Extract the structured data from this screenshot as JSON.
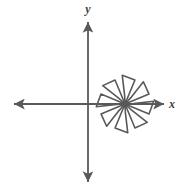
{
  "figure": {
    "kind": "coordinate-plane-with-rotational-figure",
    "background_color": "#ffffff",
    "stroke_color": "#595959",
    "label_color": "#3d3d3d",
    "width": 187,
    "height": 194
  },
  "axes": {
    "x_axis": {
      "label": "x",
      "label_x": 172,
      "label_y": 108,
      "y_position": 104,
      "x_start": 12,
      "x_end": 166,
      "arrow_both_ends": true
    },
    "y_axis": {
      "label": "y",
      "label_x": 88,
      "label_y": 13,
      "x_position": 88,
      "y_start": 20,
      "y_end": 184,
      "arrow_both_ends": true
    },
    "origin": {
      "x": 88,
      "y": 104
    }
  },
  "chart_data": {
    "type": "scatter",
    "title": "",
    "xlabel": "x",
    "ylabel": "y",
    "grid": false,
    "legend": false,
    "axis_arrows": "both",
    "shape": {
      "name": "eight-blade-pinwheel",
      "description": "Eight-fold rotationally symmetric pinwheel of triangular blades radiating from a common center point",
      "center": {
        "x": 125,
        "y": 104
      },
      "blade_count": 8,
      "rotational_symmetry_order": 8,
      "rotation_angle_degrees": 45,
      "spoke_length": 26,
      "has_reflection_symmetry": false,
      "fill": "none",
      "stroke_width": 1.6
    }
  }
}
